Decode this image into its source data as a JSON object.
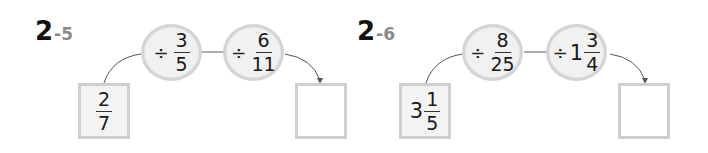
{
  "problems": [
    {
      "id": "2-5",
      "label_main": "2",
      "label_sub": "-5",
      "start": {
        "whole": "",
        "numerator": "2",
        "denominator": "7"
      },
      "operations": [
        {
          "operator": "÷",
          "whole": "",
          "numerator": "3",
          "denominator": "5"
        },
        {
          "operator": "÷",
          "whole": "",
          "numerator": "6",
          "denominator": "11"
        }
      ],
      "answer": ""
    },
    {
      "id": "2-6",
      "label_main": "2",
      "label_sub": "-6",
      "start": {
        "whole": "3",
        "numerator": "1",
        "denominator": "5"
      },
      "operations": [
        {
          "operator": "÷",
          "whole": "",
          "numerator": "8",
          "denominator": "25"
        },
        {
          "operator": "÷",
          "whole": "1",
          "numerator": "3",
          "denominator": "4"
        }
      ],
      "answer": ""
    }
  ],
  "colors": {
    "circle_fill": "#f1f1f1",
    "circle_border": "#d4d4d4",
    "box_border": "#cfcfcf",
    "given_box_fill": "#f3f3f3",
    "connector": "#555555",
    "label_sub": "#8a8a8a"
  }
}
